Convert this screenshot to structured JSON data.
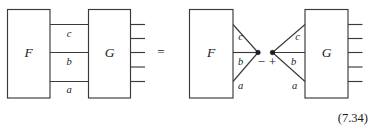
{
  "figure": {
    "equation_number": "(7.34)",
    "background_color": "#ffffff",
    "line_color": "#3a3a3a",
    "text_color": "#1a1a1a",
    "operators": {
      "equals": "=",
      "minus": "−",
      "plus": "+"
    },
    "left_side": {
      "boxes": [
        {
          "id": "F",
          "label": "F"
        },
        {
          "id": "G",
          "label": "G"
        }
      ],
      "edge_labels": [
        "c",
        "b",
        "a"
      ],
      "output_leg_count": 5
    },
    "right_side": {
      "term_one": {
        "box": {
          "id": "F",
          "label": "F"
        },
        "edge_labels": [
          "c",
          "b",
          "a"
        ],
        "operator": "−",
        "node": "vertex-dot"
      },
      "term_two": {
        "box": {
          "id": "G",
          "label": "G"
        },
        "edge_labels": [
          "c",
          "b",
          "a"
        ],
        "operator": "+",
        "node": "vertex-dot",
        "output_leg_count": 5
      }
    }
  }
}
